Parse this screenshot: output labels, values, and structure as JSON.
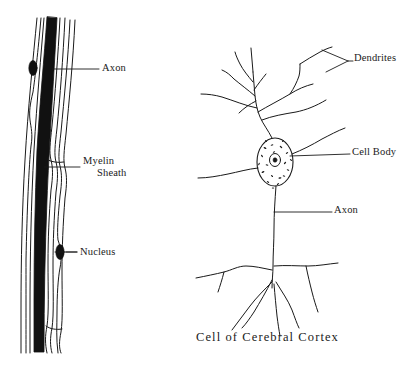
{
  "figure": {
    "caption": "Cell of Cerebral Cortex",
    "ink_color": "#1a1a1a",
    "background_color": "#ffffff",
    "width": 412,
    "height": 365
  },
  "left_panel": {
    "title": "Myelinated nerve fiber",
    "labels": {
      "axon": "Axon",
      "myelin_line1": "Myelin",
      "myelin_line2": "Sheath",
      "nucleus": "Nucleus"
    }
  },
  "right_panel": {
    "title": "Cerebral cortex neuron",
    "labels": {
      "dendrites": "Dendrites",
      "cell_body": "Cell Body",
      "axon": "Axon"
    }
  }
}
